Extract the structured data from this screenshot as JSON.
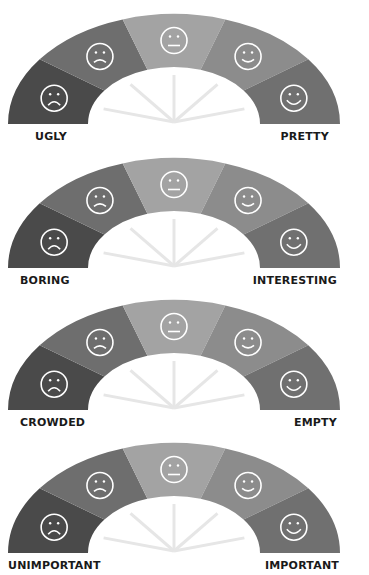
{
  "segment_colors": [
    "#4a4a4a",
    "#6e6e6e",
    "#a3a3a3",
    "#8c8c8c",
    "#707070"
  ],
  "faces": [
    "very-sad",
    "sad",
    "neutral",
    "happy",
    "very-happy"
  ],
  "scales": [
    {
      "left_label": "UGLY",
      "right_label": "PRETTY"
    },
    {
      "left_label": "BORING",
      "right_label": "INTERESTING"
    },
    {
      "left_label": "CROWDED",
      "right_label": "EMPTY"
    },
    {
      "left_label": "UNIMPORTANT",
      "right_label": "IMPORTANT"
    }
  ]
}
